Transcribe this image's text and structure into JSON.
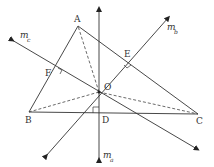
{
  "diagram": {
    "colors": {
      "line": "#333333",
      "background": "#ffffff"
    },
    "points": {
      "A": {
        "label": "A",
        "x": 78,
        "y": 26
      },
      "B": {
        "label": "B",
        "x": 29,
        "y": 112
      },
      "C": {
        "label": "C",
        "x": 198,
        "y": 114
      },
      "O": {
        "label": "O",
        "x": 99,
        "y": 92
      },
      "D": {
        "label": "D",
        "x": 99,
        "y": 113
      },
      "E": {
        "label": "E",
        "x": 128,
        "y": 62
      },
      "F": {
        "label": "F",
        "x": 57,
        "y": 73
      }
    },
    "lines": {
      "m_a": {
        "label": "m",
        "subscript": "a"
      },
      "m_b": {
        "label": "m",
        "subscript": "b"
      },
      "m_c": {
        "label": "m",
        "subscript": "c"
      }
    },
    "segments": [
      "AB",
      "BC",
      "CA"
    ],
    "dashed_segments": [
      "OA",
      "OB",
      "OC"
    ],
    "right_angle_marks": [
      "D",
      "E",
      "F"
    ]
  }
}
